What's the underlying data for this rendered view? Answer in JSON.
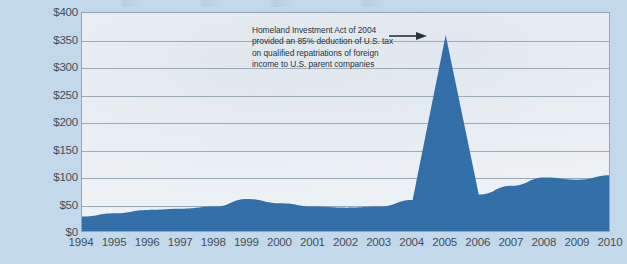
{
  "chart_data": {
    "type": "area",
    "title": "",
    "xlabel": "",
    "ylabel": "",
    "grid": true,
    "legend": "none",
    "x": [
      1994,
      1995,
      1996,
      1997,
      1998,
      1999,
      2000,
      2001,
      2002,
      2003,
      2004,
      2005,
      2006,
      2007,
      2008,
      2009,
      2010
    ],
    "categories": [
      "1994",
      "1995",
      "1996",
      "1997",
      "1998",
      "1999",
      "2000",
      "2001",
      "2002",
      "2003",
      "2004",
      "2005",
      "2006",
      "2007",
      "2008",
      "2009",
      "2010"
    ],
    "values": [
      30,
      36,
      42,
      44,
      48,
      62,
      54,
      48,
      46,
      48,
      60,
      360,
      70,
      86,
      101,
      97,
      105
    ],
    "ylim": [
      0,
      400
    ],
    "xlim": [
      1994,
      2010
    ],
    "ytick_values": [
      0,
      50,
      100,
      150,
      200,
      250,
      300,
      350,
      400
    ],
    "ytick_labels": [
      "$0",
      "$50",
      "$100",
      "$150",
      "$200",
      "$250",
      "$300",
      "$350",
      "$400"
    ],
    "series_color": "#2f6ca5",
    "annotations": [
      {
        "lines": [
          "Homeland Investment Act of 2004",
          "provided an 85% deduction of U.S. tax",
          "on qualified repatriations of foreign",
          "income to U.S. parent companies"
        ],
        "points_to": "2005",
        "arrow": "arrow-right-icon"
      }
    ]
  },
  "colors": {
    "page_background": "#c3d8ea",
    "plot_background": "#eef2f5",
    "plot_border": "#8fa4b4",
    "gridline": "#9aa9b4",
    "area_fill": "#2f6ca5",
    "axis_text": "#3e4b55",
    "annotation_text": "#23313c"
  }
}
